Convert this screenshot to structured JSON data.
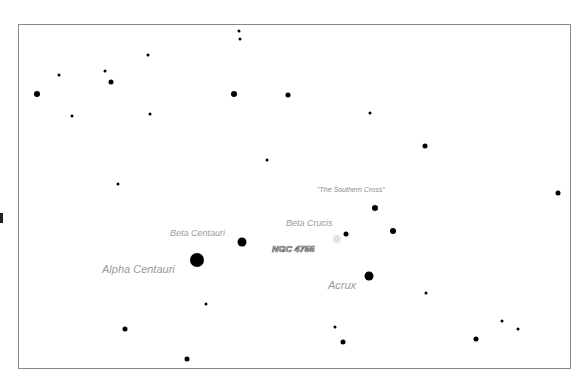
{
  "chart_data": {
    "type": "scatter",
    "title": "",
    "xlabel": "",
    "ylabel": "",
    "grid": false,
    "frame": {
      "left": 18,
      "top": 24,
      "right": 571,
      "bottom": 369,
      "color": "#8a8a8a"
    },
    "colors": {
      "star": "#000000",
      "label": "#9a9a9a",
      "ngc_label_stroke": "#555555",
      "nebula": "#e4e4e4"
    },
    "stars": [
      {
        "x": 37,
        "y": 94,
        "size": "s3"
      },
      {
        "x": 59,
        "y": 75,
        "size": "s1"
      },
      {
        "x": 72,
        "y": 116,
        "size": "s1"
      },
      {
        "x": 105,
        "y": 71,
        "size": "s1"
      },
      {
        "x": 111,
        "y": 82,
        "size": "s2"
      },
      {
        "x": 148,
        "y": 55,
        "size": "s1"
      },
      {
        "x": 150,
        "y": 114,
        "size": "s1"
      },
      {
        "x": 239,
        "y": 31,
        "size": "s1"
      },
      {
        "x": 240,
        "y": 39,
        "size": "s1"
      },
      {
        "x": 234,
        "y": 94,
        "size": "s3"
      },
      {
        "x": 288,
        "y": 95,
        "size": "s2"
      },
      {
        "x": 267,
        "y": 160,
        "size": "s1"
      },
      {
        "x": 370,
        "y": 113,
        "size": "s1"
      },
      {
        "x": 425,
        "y": 146,
        "size": "s2"
      },
      {
        "x": 558,
        "y": 193,
        "size": "s2"
      },
      {
        "x": 118,
        "y": 184,
        "size": "s1"
      },
      {
        "x": 242,
        "y": 242,
        "size": "s4",
        "name": "Beta Centauri"
      },
      {
        "x": 197,
        "y": 260,
        "size": "s5",
        "name": "Alpha Centauri"
      },
      {
        "x": 206,
        "y": 304,
        "size": "s1"
      },
      {
        "x": 375,
        "y": 208,
        "size": "s3"
      },
      {
        "x": 346,
        "y": 234,
        "size": "s2",
        "name": "Beta Crucis"
      },
      {
        "x": 393,
        "y": 231,
        "size": "s3"
      },
      {
        "x": 369,
        "y": 276,
        "size": "s4",
        "name": "Acrux"
      },
      {
        "x": 125,
        "y": 329,
        "size": "s2"
      },
      {
        "x": 187,
        "y": 359,
        "size": "s2"
      },
      {
        "x": 335,
        "y": 327,
        "size": "s1"
      },
      {
        "x": 343,
        "y": 342,
        "size": "s2"
      },
      {
        "x": 426,
        "y": 293,
        "size": "s1"
      },
      {
        "x": 476,
        "y": 339,
        "size": "s2"
      },
      {
        "x": 502,
        "y": 321,
        "size": "s1"
      },
      {
        "x": 518,
        "y": 329,
        "size": "s1"
      }
    ],
    "nebulae": [
      {
        "x": 337,
        "y": 239,
        "name": "NGC 4755"
      }
    ],
    "labels": [
      {
        "text": "\"The Southern Cross\"",
        "x": 317,
        "y": 186,
        "style": "small"
      },
      {
        "text": "Beta Crucis",
        "x": 286,
        "y": 219,
        "style": "med"
      },
      {
        "text": "Beta Centauri",
        "x": 170,
        "y": 229,
        "style": "med"
      },
      {
        "text": "NGC 4755",
        "x": 272,
        "y": 245,
        "style": "ngc"
      },
      {
        "text": "Alpha Centauri",
        "x": 102,
        "y": 264,
        "style": "big"
      },
      {
        "text": "Acrux",
        "x": 328,
        "y": 280,
        "style": "big"
      }
    ]
  }
}
